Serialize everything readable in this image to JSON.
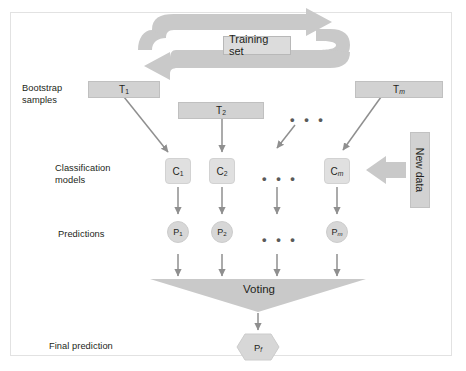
{
  "diagram": {
    "colors": {
      "box_fill": "#d2d2d2",
      "model_fill": "#e0e0e0",
      "arrow_fill": "#c9c9c9",
      "thin_arrow": "#8f8f8f",
      "text": "#231f20",
      "frame_border": "#e2e2e2",
      "page_background": "#ffffff"
    },
    "cycle": {
      "label": "Training set"
    },
    "rows": [
      {
        "key": "bootstrap",
        "label": "Bootstrap\nsamples"
      },
      {
        "key": "models",
        "label": "Classification\nmodels"
      },
      {
        "key": "predictions",
        "label": "Predictions"
      },
      {
        "key": "final",
        "label": "Final prediction"
      }
    ],
    "bootstrap_samples": [
      {
        "base": "T",
        "sub": "1",
        "italic_sub": false
      },
      {
        "base": "T",
        "sub": "2",
        "italic_sub": false
      },
      {
        "base": "T",
        "sub": "m",
        "italic_sub": true
      }
    ],
    "classification_models": [
      {
        "base": "C",
        "sub": "1",
        "italic_sub": false
      },
      {
        "base": "C",
        "sub": "2",
        "italic_sub": false
      },
      {
        "base": "C",
        "sub": "m",
        "italic_sub": true
      }
    ],
    "predictions": [
      {
        "base": "P",
        "sub": "1",
        "italic_sub": false
      },
      {
        "base": "P",
        "sub": "2",
        "italic_sub": false
      },
      {
        "base": "P",
        "sub": "m",
        "italic_sub": true
      }
    ],
    "new_data": {
      "label": "New data"
    },
    "voting": {
      "label": "Voting"
    },
    "final_prediction": {
      "base": "P",
      "sub": "f",
      "italic_sub": true
    },
    "ellipses": [
      {
        "key": "samples-row",
        "text": "• • •"
      },
      {
        "key": "models-row",
        "text": "• • •"
      },
      {
        "key": "predictions-row",
        "text": "• • •"
      }
    ]
  }
}
